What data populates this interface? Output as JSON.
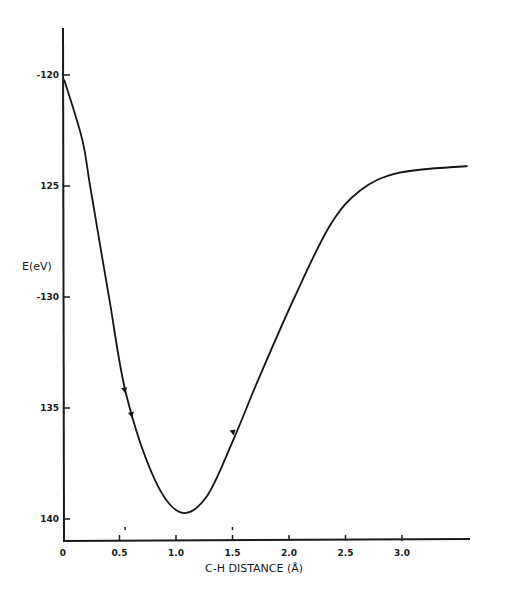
{
  "chart_data": {
    "type": "line",
    "title": "",
    "xlabel": "C-H DISTANCE (Å)",
    "ylabel": "E(eV)",
    "xlim": [
      0,
      3.6
    ],
    "ylim": [
      -141.5,
      -118
    ],
    "x_ticks": [
      0,
      0.5,
      1.0,
      1.5,
      2.0,
      2.5,
      3.0
    ],
    "x_tick_labels": [
      "0",
      "0.5",
      "1.0",
      "1.5",
      "2.0",
      "2.5",
      "3.0"
    ],
    "y_ticks": [
      -120,
      -125,
      -130,
      -135,
      -140
    ],
    "y_tick_labels": [
      "-120",
      "125",
      "-130",
      "135",
      "140"
    ],
    "grid": false,
    "legend": "none",
    "series": [
      {
        "name": "E(r)",
        "x": [
          0.01,
          0.17,
          0.24,
          0.41,
          0.56,
          0.81,
          1.04,
          1.27,
          1.51,
          1.73,
          2.05,
          2.36,
          2.63,
          2.98,
          3.58
        ],
        "y": [
          -120.2,
          -122.9,
          -125.0,
          -130.1,
          -134.4,
          -138.2,
          -139.7,
          -139.0,
          -136.4,
          -133.7,
          -130.0,
          -126.8,
          -125.2,
          -124.4,
          -124.1
        ]
      }
    ],
    "annotations": [
      {
        "type": "marker",
        "x": 0.55,
        "y": -134.2
      },
      {
        "type": "marker",
        "x": 0.61,
        "y": -135.3
      },
      {
        "type": "marker",
        "x": 1.51,
        "y": -136.1
      }
    ],
    "x_small_marks": [
      0.55,
      1.5
    ]
  }
}
